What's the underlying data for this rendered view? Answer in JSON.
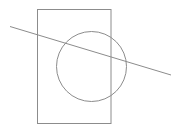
{
  "diagram": {
    "shapes": [
      {
        "type": "rectangle",
        "name": "rectangle"
      },
      {
        "type": "circle",
        "name": "circle"
      },
      {
        "type": "line",
        "name": "secant-line"
      }
    ],
    "colors": {
      "stroke": "#8c8c8c",
      "background": "#ffffff"
    }
  }
}
